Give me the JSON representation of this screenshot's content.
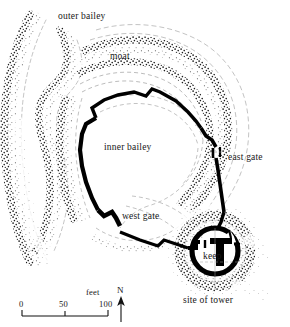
{
  "map": {
    "kind": "archaeological-castle-plan",
    "background_color": "#ffffff",
    "ink_color": "#111111",
    "labels": {
      "outer_bailey": "outer bailey",
      "moat": "moat",
      "inner_bailey": "inner bailey",
      "east_gate": "east gate",
      "west_gate": "west gate",
      "keep": "keep",
      "site_of_tower": "site of tower"
    },
    "features": [
      {
        "name": "outer-bailey",
        "label": "outer bailey",
        "type": "earthwork-enclosure"
      },
      {
        "name": "moat",
        "label": "moat",
        "type": "ditch"
      },
      {
        "name": "inner-bailey",
        "label": "inner bailey",
        "type": "walled-enclosure"
      },
      {
        "name": "east-gate",
        "label": "east gate",
        "type": "gateway"
      },
      {
        "name": "west-gate",
        "label": "west gate",
        "type": "gateway"
      },
      {
        "name": "keep",
        "label": "keep",
        "type": "shell-keep"
      },
      {
        "name": "site-of-tower",
        "label": "site of tower",
        "type": "ruin-site"
      }
    ]
  },
  "scale_bar": {
    "unit_label": "feet",
    "ticks": [
      "0",
      "50",
      "100"
    ],
    "min": 0,
    "max": 100
  },
  "compass": {
    "label": "N",
    "direction": "up"
  },
  "icons": {
    "north_arrow": "north-arrow-icon",
    "scale_bar": "scale-bar-icon"
  }
}
